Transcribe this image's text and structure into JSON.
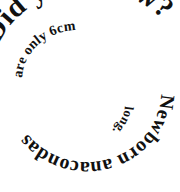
{
  "image": {
    "kind": "spiral-text-graphic",
    "background_color": "#ffffff",
    "text_color": "#111111",
    "width": 180,
    "height": 192
  },
  "spiral": {
    "full_text": "Did you know? Newborn anacondas are only 6cm long.",
    "direction": "clockwise-inward",
    "start_position": "upper-left",
    "segments": [
      {
        "id": "outer",
        "text": "Did you know?",
        "size": "large",
        "turn": 1
      },
      {
        "id": "middle",
        "text": "Newborn anacondas",
        "size": "medium",
        "turn": 2
      },
      {
        "id": "inner",
        "text": "are only 6cm",
        "size": "small",
        "turn": 3
      },
      {
        "id": "core",
        "text": "long.",
        "size": "smallest",
        "turn": 4
      }
    ]
  }
}
